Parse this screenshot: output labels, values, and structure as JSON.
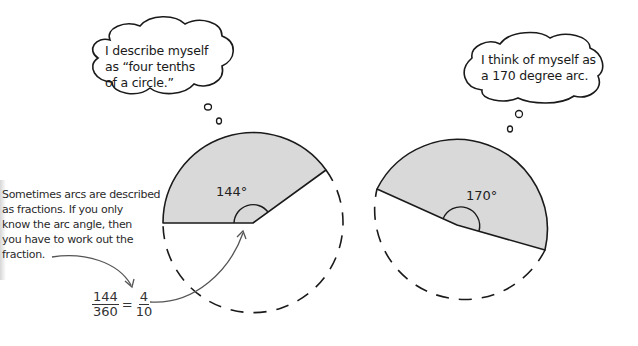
{
  "bubbles": {
    "left": {
      "lines": [
        "I describe myself",
        "as “four tenths",
        "of a circle.”"
      ]
    },
    "right": {
      "lines": [
        "I think of myself as",
        "a 170 degree arc."
      ]
    }
  },
  "note": {
    "lines": [
      "Sometimes arcs are described",
      "as fractions. If you only",
      "know the arc angle, then",
      "you have to work out the",
      "fraction."
    ]
  },
  "diagrams": {
    "left": {
      "angle_label": "144°",
      "angle_deg": 144
    },
    "right": {
      "angle_label": "170°",
      "angle_deg": 170
    }
  },
  "equation": {
    "lhs_num": "144",
    "lhs_den": "360",
    "equals": "=",
    "rhs_num": "4",
    "rhs_den": "10"
  },
  "colors": {
    "sector_fill": "#d9d9d9",
    "stroke": "#1a1a1a",
    "arrow": "#555555"
  }
}
